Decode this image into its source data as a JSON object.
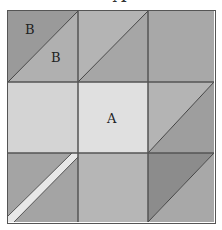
{
  "title": {
    "text": "A",
    "clipped": true
  },
  "grid": {
    "rows": 3,
    "cols": 3,
    "border_color": "#555555",
    "cells": [
      {
        "row": 0,
        "col": 0,
        "type": "half-square-triangle",
        "diagonal": "bottom-left-to-top-right",
        "upper_left_color": "#9a9a9a",
        "lower_right_color": "#b0b0b0",
        "labels": [
          "B",
          "B"
        ]
      },
      {
        "row": 0,
        "col": 1,
        "type": "half-square-triangle",
        "diagonal": "bottom-left-to-top-right",
        "upper_left_color": "#b4b4b4",
        "lower_right_color": "#a6a6a6",
        "labels": []
      },
      {
        "row": 0,
        "col": 2,
        "type": "solid",
        "color": "#a8a8a8",
        "labels": []
      },
      {
        "row": 1,
        "col": 0,
        "type": "solid",
        "color": "#d4d4d4",
        "labels": []
      },
      {
        "row": 1,
        "col": 1,
        "type": "solid",
        "color": "#e0e0e0",
        "labels": [
          "A"
        ]
      },
      {
        "row": 1,
        "col": 2,
        "type": "half-square-triangle",
        "diagonal": "bottom-left-to-top-right",
        "upper_left_color": "#b4b4b4",
        "lower_right_color": "#9e9e9e",
        "labels": []
      },
      {
        "row": 2,
        "col": 0,
        "type": "stripe",
        "diagonal": "bottom-left-to-top-right",
        "color": "#a4a4a4",
        "stripe_color": "#e8e8e8",
        "labels": []
      },
      {
        "row": 2,
        "col": 1,
        "type": "solid",
        "color": "#b6b6b6",
        "labels": []
      },
      {
        "row": 2,
        "col": 2,
        "type": "half-square-triangle",
        "diagonal": "bottom-left-to-top-right",
        "upper_left_color": "#8c8c8c",
        "lower_right_color": "#a8a8a8",
        "labels": []
      }
    ]
  },
  "labels": {
    "b1": "B",
    "b2": "B",
    "a": "A"
  }
}
